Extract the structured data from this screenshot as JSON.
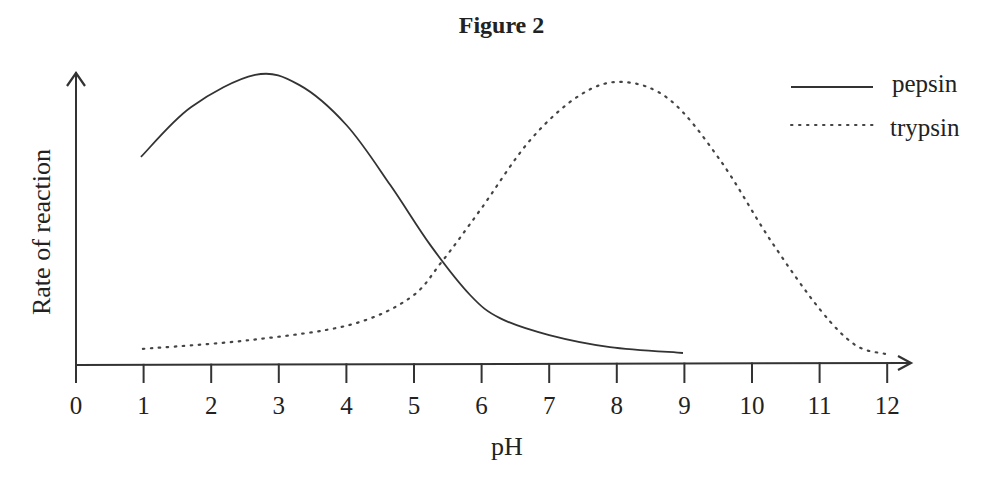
{
  "figure": {
    "title": "Figure 2"
  },
  "axes": {
    "xlabel": "pH",
    "ylabel": "Rate of reaction",
    "xticks": [
      "0",
      "1",
      "2",
      "3",
      "4",
      "5",
      "6",
      "7",
      "8",
      "9",
      "10",
      "11",
      "12"
    ]
  },
  "legend": {
    "items": [
      {
        "label": "pepsin",
        "style": "solid"
      },
      {
        "label": "trypsin",
        "style": "dotted"
      }
    ]
  },
  "colors": {
    "line": "#333333",
    "axis": "#333333",
    "background": "#ffffff"
  },
  "chart_data": {
    "type": "line",
    "title": "Figure 2",
    "xlabel": "pH",
    "ylabel": "Rate of reaction",
    "xlim": [
      0,
      12
    ],
    "ylim": [
      0,
      10
    ],
    "y_units": "arbitrary (no tick labels shown)",
    "grid": false,
    "legend_position": "top-right",
    "series": [
      {
        "name": "pepsin",
        "line_style": "solid",
        "x": [
          0.96,
          1.7,
          2.65,
          3.3,
          4.0,
          4.65,
          5.24,
          5.83,
          6.27,
          7.0,
          7.9,
          8.98
        ],
        "y": [
          7.1,
          8.8,
          9.9,
          9.56,
          8.19,
          6.14,
          4.1,
          2.39,
          1.6,
          1.02,
          0.61,
          0.41
        ]
      },
      {
        "name": "trypsin",
        "line_style": "dotted",
        "x": [
          0.99,
          2.57,
          4.05,
          4.94,
          5.41,
          5.98,
          6.72,
          7.46,
          8.09,
          8.79,
          9.53,
          10.27,
          11.01,
          11.53,
          11.97
        ],
        "y": [
          0.55,
          0.85,
          1.37,
          2.29,
          3.52,
          5.29,
          7.68,
          9.22,
          9.66,
          9.04,
          6.99,
          4.27,
          1.88,
          0.68,
          0.38
        ]
      }
    ]
  }
}
